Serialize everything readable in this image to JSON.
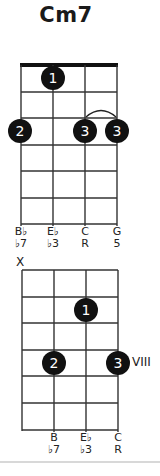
{
  "title": "Cm7",
  "colors": {
    "dot": "#111111",
    "dot_text": "#ffffff",
    "line": "#333333",
    "nut": "#111111",
    "rule": "#d8d8d8"
  },
  "diagrams": [
    {
      "id": "open",
      "nut": true,
      "position_label": "",
      "muted": [],
      "strings": [
        {
          "note": "B♭",
          "interval": "♭7"
        },
        {
          "note": "E♭",
          "interval": "♭3"
        },
        {
          "note": "C",
          "interval": "R"
        },
        {
          "note": "G",
          "interval": "5"
        }
      ],
      "dots": [
        {
          "string": 2,
          "fret": 1,
          "finger": "1"
        },
        {
          "string": 1,
          "fret": 3,
          "finger": "2"
        },
        {
          "string": 3,
          "fret": 3,
          "finger": "3"
        },
        {
          "string": 4,
          "fret": 3,
          "finger": "3"
        }
      ],
      "barre_tie": {
        "from_string": 3,
        "to_string": 4,
        "fret": 3
      }
    },
    {
      "id": "position-viii",
      "nut": false,
      "position_label": "VIII",
      "muted_label": "X",
      "muted": [
        1
      ],
      "strings": [
        {
          "note": "",
          "interval": ""
        },
        {
          "note": "B",
          "interval": "♭7"
        },
        {
          "note": "E♭",
          "interval": "♭3"
        },
        {
          "note": "C",
          "interval": "R"
        }
      ],
      "dots": [
        {
          "string": 3,
          "fret": 2,
          "finger": "1"
        },
        {
          "string": 2,
          "fret": 4,
          "finger": "2"
        },
        {
          "string": 4,
          "fret": 4,
          "finger": "3"
        }
      ]
    }
  ]
}
